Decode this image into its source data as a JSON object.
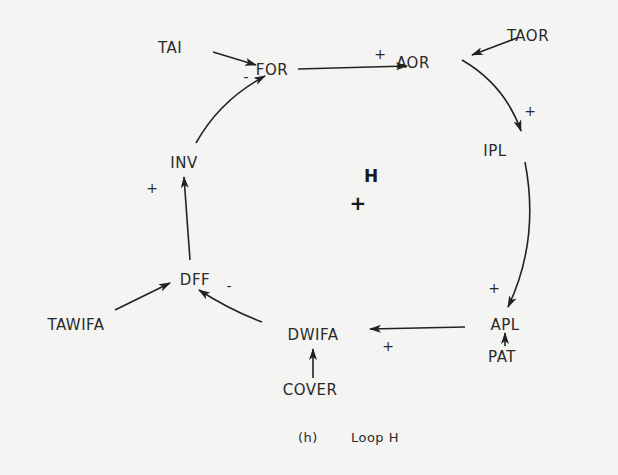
{
  "diagram": {
    "loop_label": "H",
    "loop_polarity": "+",
    "caption_prefix": "(h)",
    "caption": "Loop H",
    "colors": {
      "ink": "#222222",
      "paper": "#f4f4f2"
    },
    "nodes": {
      "tai": "TAI",
      "for": "FOR",
      "aor": "AOR",
      "taor": "TAOR",
      "ipl": "IPL",
      "apl": "APL",
      "pat": "PAT",
      "dwifa": "DWIFA",
      "cover": "COVER",
      "dff": "DFF",
      "tawifa": "TAWIFA",
      "inv": "INV"
    },
    "links": [
      {
        "from": "TAI",
        "to": "FOR",
        "polarity": "-"
      },
      {
        "from": "INV",
        "to": "FOR",
        "polarity": ""
      },
      {
        "from": "FOR",
        "to": "AOR",
        "polarity": "+"
      },
      {
        "from": "TAOR",
        "to": "AOR",
        "polarity": ""
      },
      {
        "from": "AOR",
        "to": "IPL",
        "polarity": "+"
      },
      {
        "from": "IPL",
        "to": "APL",
        "polarity": "+"
      },
      {
        "from": "PAT",
        "to": "APL",
        "polarity": ""
      },
      {
        "from": "APL",
        "to": "DWIFA",
        "polarity": "+"
      },
      {
        "from": "COVER",
        "to": "DWIFA",
        "polarity": ""
      },
      {
        "from": "DWIFA",
        "to": "DFF",
        "polarity": "-"
      },
      {
        "from": "TAWIFA",
        "to": "DFF",
        "polarity": ""
      },
      {
        "from": "DFF",
        "to": "INV",
        "polarity": "+"
      }
    ],
    "signs": {
      "tai_for": "-",
      "for_aor": "+",
      "aor_ipl": "+",
      "ipl_apl": "+",
      "apl_dwifa": "+",
      "dwifa_dff": "-",
      "dff_inv": "+"
    }
  }
}
